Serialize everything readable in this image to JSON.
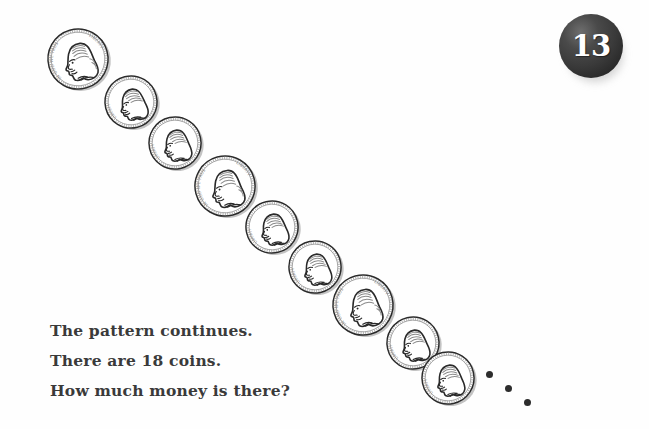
{
  "page": {
    "background_color": "#fefefe",
    "width": 649,
    "height": 429
  },
  "badge": {
    "number": "13",
    "fill_color": "#3a3a3a",
    "text_color": "#ffffff",
    "shape": "circle"
  },
  "question": {
    "lines": [
      "The pattern continues.",
      "There are 18 coins.",
      "How much money is there?"
    ],
    "text_color": "#3a3a3a"
  },
  "coin_pattern": {
    "repeat_unit": [
      "nickel",
      "dime",
      "dime"
    ],
    "total_coins_stated": 18,
    "visible_coins": 9,
    "continuation_marker": "ellipsis-three-dots",
    "coins": [
      {
        "index": 1,
        "type": "nickel",
        "value_cents": 5,
        "label_left": "IN GOD WE TRUST",
        "label_right": "LIBERTY",
        "cx": 78,
        "cy": 59,
        "r": 30,
        "rot": -16
      },
      {
        "index": 2,
        "type": "dime",
        "value_cents": 10,
        "label_left": "LIBERTY",
        "label_right": "",
        "cx": 131,
        "cy": 102,
        "r": 26,
        "rot": -14
      },
      {
        "index": 3,
        "type": "dime",
        "value_cents": 10,
        "label_left": "LIBERTY",
        "label_right": "",
        "cx": 175,
        "cy": 143,
        "r": 26,
        "rot": -12
      },
      {
        "index": 4,
        "type": "nickel",
        "value_cents": 5,
        "label_left": "IN GOD WE TRUST",
        "label_right": "LIBERTY",
        "cx": 225,
        "cy": 186,
        "r": 30,
        "rot": -15
      },
      {
        "index": 5,
        "type": "dime",
        "value_cents": 10,
        "label_left": "LIBERTY",
        "label_right": "",
        "cx": 272,
        "cy": 227,
        "r": 26,
        "rot": -13
      },
      {
        "index": 6,
        "type": "dime",
        "value_cents": 10,
        "label_left": "LIBERTY",
        "label_right": "",
        "cx": 315,
        "cy": 267,
        "r": 26,
        "rot": -12
      },
      {
        "index": 7,
        "type": "nickel",
        "value_cents": 5,
        "label_left": "IN GOD WE TRUST",
        "label_right": "LIBERTY",
        "cx": 363,
        "cy": 305,
        "r": 30,
        "rot": -15
      },
      {
        "index": 8,
        "type": "dime",
        "value_cents": 10,
        "label_left": "LIBERTY",
        "label_right": "",
        "cx": 413,
        "cy": 343,
        "r": 26,
        "rot": -13
      },
      {
        "index": 9,
        "type": "dime",
        "value_cents": 10,
        "label_left": "LIBERTY",
        "label_right": "",
        "cx": 448,
        "cy": 378,
        "r": 26,
        "rot": -12
      }
    ]
  },
  "dots": [
    {
      "x": 489,
      "y": 374
    },
    {
      "x": 508,
      "y": 388
    },
    {
      "x": 527,
      "y": 402
    }
  ]
}
